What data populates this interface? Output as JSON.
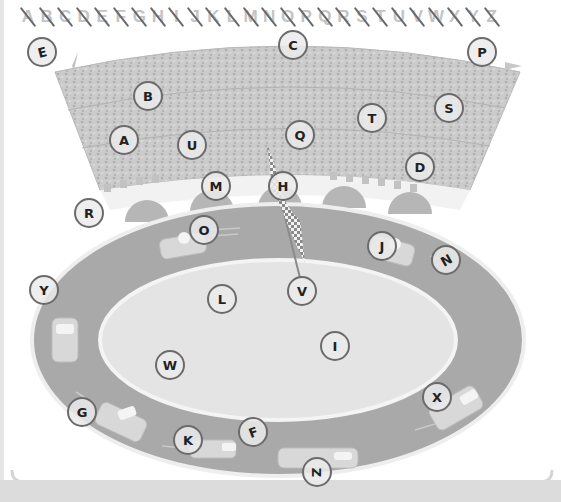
{
  "worksheet": {
    "alphabet_strip": {
      "letters": [
        "A",
        "B",
        "C",
        "D",
        "E",
        "F",
        "G",
        "H",
        "I",
        "J",
        "K",
        "L",
        "M",
        "N",
        "O",
        "P",
        "Q",
        "R",
        "S",
        "T",
        "U",
        "V",
        "W",
        "X",
        "Y",
        "Z"
      ],
      "all_crossed_out": true
    },
    "scene": {
      "description": "race track stadium with checkered flag and cars",
      "colors": {
        "background": "#ffffff",
        "stands": "#c8c8c8",
        "track": "#a8a8a8",
        "infield": "#e2e2e2",
        "domes": "#b4b4b4",
        "circle_border": "#6b6b6b",
        "crossout": "#6a6a6a"
      }
    },
    "hidden_letters": [
      {
        "letter": "E",
        "x": 42,
        "y": 52,
        "rotation": -15
      },
      {
        "letter": "C",
        "x": 293,
        "y": 45,
        "rotation": 0
      },
      {
        "letter": "P",
        "x": 482,
        "y": 52,
        "rotation": 0
      },
      {
        "letter": "B",
        "x": 148,
        "y": 96,
        "rotation": 0
      },
      {
        "letter": "A",
        "x": 124,
        "y": 140,
        "rotation": 0
      },
      {
        "letter": "U",
        "x": 192,
        "y": 145,
        "rotation": 0
      },
      {
        "letter": "Q",
        "x": 300,
        "y": 135,
        "rotation": 0
      },
      {
        "letter": "T",
        "x": 372,
        "y": 118,
        "rotation": 0
      },
      {
        "letter": "S",
        "x": 449,
        "y": 108,
        "rotation": 0
      },
      {
        "letter": "D",
        "x": 420,
        "y": 167,
        "rotation": 0
      },
      {
        "letter": "M",
        "x": 216,
        "y": 186,
        "rotation": 0
      },
      {
        "letter": "H",
        "x": 283,
        "y": 186,
        "rotation": 0
      },
      {
        "letter": "R",
        "x": 89,
        "y": 213,
        "rotation": 0
      },
      {
        "letter": "O",
        "x": 204,
        "y": 230,
        "rotation": 0
      },
      {
        "letter": "J",
        "x": 382,
        "y": 246,
        "rotation": 0
      },
      {
        "letter": "N",
        "x": 446,
        "y": 260,
        "rotation": -30
      },
      {
        "letter": "Y",
        "x": 44,
        "y": 290,
        "rotation": 0
      },
      {
        "letter": "L",
        "x": 222,
        "y": 299,
        "rotation": 0
      },
      {
        "letter": "V",
        "x": 302,
        "y": 291,
        "rotation": 0
      },
      {
        "letter": "I",
        "x": 335,
        "y": 346,
        "rotation": 0
      },
      {
        "letter": "W",
        "x": 170,
        "y": 365,
        "rotation": 0
      },
      {
        "letter": "G",
        "x": 82,
        "y": 412,
        "rotation": 0
      },
      {
        "letter": "X",
        "x": 437,
        "y": 397,
        "rotation": 0
      },
      {
        "letter": "K",
        "x": 188,
        "y": 440,
        "rotation": 0
      },
      {
        "letter": "F",
        "x": 253,
        "y": 432,
        "rotation": -20
      },
      {
        "letter": "Z",
        "x": 317,
        "y": 472,
        "rotation": 90
      }
    ]
  }
}
